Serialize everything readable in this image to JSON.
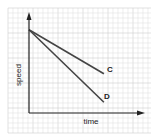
{
  "chart_data": {
    "type": "line",
    "title": "",
    "xlabel": "time",
    "ylabel": "speed",
    "grid": true,
    "xlim": [
      0,
      10
    ],
    "ylim": [
      0,
      10
    ],
    "series": [
      {
        "name": "C",
        "x": [
          0,
          7.0
        ],
        "y": [
          8.5,
          4.0
        ]
      },
      {
        "name": "D",
        "x": [
          0,
          7.0
        ],
        "y": [
          8.5,
          1.1
        ]
      }
    ],
    "annotations": [
      "C",
      "D"
    ]
  },
  "colors": {
    "line": "#444444",
    "axis": "#222222",
    "grid_minor": "#e2e2e2",
    "grid_major": "#cfcfcf"
  }
}
